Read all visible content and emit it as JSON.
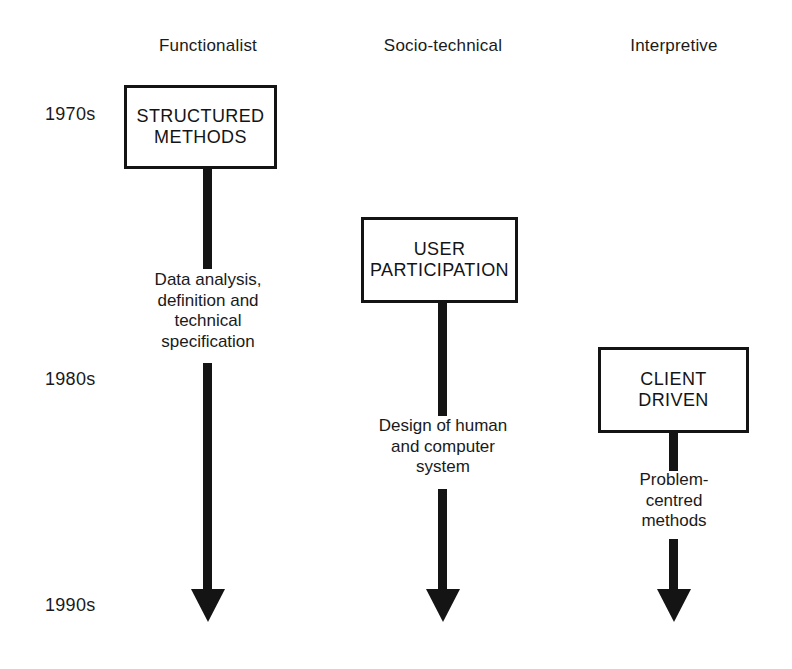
{
  "figure": {
    "background_color": "#ffffff",
    "ink_color": "#141414"
  },
  "columns": [
    {
      "id": "functionalist",
      "label": "Functionalist",
      "center_x": 208
    },
    {
      "id": "socio-technical",
      "label": "Socio-technical",
      "center_x": 443
    },
    {
      "id": "interpretive",
      "label": "Interpretive",
      "center_x": 674
    }
  ],
  "timeline": {
    "decades": [
      {
        "label": "1970s",
        "x": 45,
        "y": 104
      },
      {
        "label": "1980s",
        "x": 45,
        "y": 369
      },
      {
        "label": "1990s",
        "x": 45,
        "y": 595
      }
    ]
  },
  "nodes": [
    {
      "id": "structured-methods",
      "label": "STRUCTURED\nMETHODS",
      "column": "functionalist",
      "x": 124,
      "y": 85,
      "width": 153,
      "height": 84
    },
    {
      "id": "user-participation",
      "label": "USER\nPARTICIPATION",
      "column": "socio-technical",
      "x": 361,
      "y": 217,
      "width": 157,
      "height": 86
    },
    {
      "id": "client-driven",
      "label": "CLIENT\nDRIVEN",
      "column": "interpretive",
      "x": 598,
      "y": 347,
      "width": 151,
      "height": 86
    }
  ],
  "flows": [
    {
      "id": "functionalist-flow",
      "column": "functionalist",
      "center_x": 208,
      "stem_upper": {
        "y": 169,
        "height": 100
      },
      "caption": "Data analysis,\ndefinition and\ntechnical\nspecification",
      "caption_y": 270,
      "stem_lower": {
        "y": 363,
        "height": 226
      },
      "arrow_tip_y": 622
    },
    {
      "id": "socio-technical-flow",
      "column": "socio-technical",
      "center_x": 443,
      "stem_upper": {
        "y": 303,
        "height": 113
      },
      "caption": "Design of human\nand computer\nsystem",
      "caption_y": 416,
      "stem_lower": {
        "y": 489,
        "height": 100
      },
      "arrow_tip_y": 622
    },
    {
      "id": "interpretive-flow",
      "column": "interpretive",
      "center_x": 674,
      "stem_upper": {
        "y": 433,
        "height": 38
      },
      "caption": "Problem-\ncentred\nmethods",
      "caption_y": 470,
      "stem_lower": {
        "y": 539,
        "height": 50
      },
      "arrow_tip_y": 622
    }
  ],
  "headers_y": 36
}
